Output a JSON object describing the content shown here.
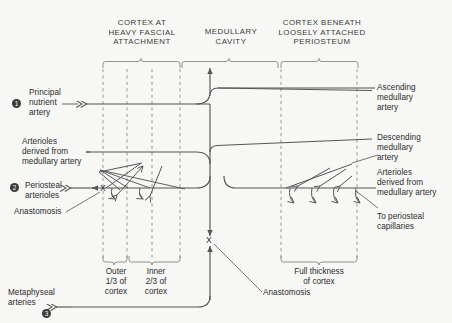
{
  "diagram": {
    "background_color": "#f7f7f5",
    "line_color": "#555555",
    "dashed_color": "#8a8a8a",
    "text_color": "#2b2b2b"
  },
  "headers": [
    {
      "id": "cortex-heavy-fascial",
      "text": "CORTEX AT\nHEAVY FASCIAL\nATTACHMENT"
    },
    {
      "id": "medullary-cavity",
      "text": "MEDULLARY\nCAVITY"
    },
    {
      "id": "cortex-loose-periosteum",
      "text": "CORTEX BENEATH\nLOOSELY ATTACHED\nPERIOSTEUM"
    }
  ],
  "left_labels": [
    {
      "id": "principal-nutrient-artery",
      "text": "Principal\nnutrient\nartery",
      "bullet": "1"
    },
    {
      "id": "arterioles-from-medullary-left",
      "text": "Arterioles\nderived from\nmedullary artery",
      "bullet": ""
    },
    {
      "id": "periosteal-arterioles",
      "text": "Periosteal\narterioles",
      "bullet": "2"
    },
    {
      "id": "anastomosis-left",
      "text": "Anastomosis",
      "bullet": ""
    },
    {
      "id": "metaphyseal-arteries",
      "text": "Metaphyseal\narteries",
      "bullet": "3"
    }
  ],
  "right_labels": [
    {
      "id": "ascending-medullary-artery",
      "text": "Ascending\nmedullary\nartery"
    },
    {
      "id": "descending-medullary-artery",
      "text": "Descending\nmedullary\nartery"
    },
    {
      "id": "arterioles-from-medullary-right",
      "text": "Arterioles\nderived from\nmedullary artery"
    },
    {
      "id": "to-periosteal-capillaries",
      "text": "To periosteal\ncapillaries"
    },
    {
      "id": "anastomosis-bottom",
      "text": "Anastomosis"
    }
  ],
  "bracket_labels": [
    {
      "id": "outer-third-cortex",
      "text": "Outer\n1/3 of\ncortex"
    },
    {
      "id": "inner-two-thirds-cortex",
      "text": "Inner\n2/3 of\ncortex"
    },
    {
      "id": "full-thickness-cortex",
      "text": "Full thickness\nof cortex"
    }
  ],
  "markers": [
    {
      "id": "anastomosis-x-left",
      "text": "X"
    },
    {
      "id": "anastomosis-x-center",
      "text": "X"
    }
  ]
}
